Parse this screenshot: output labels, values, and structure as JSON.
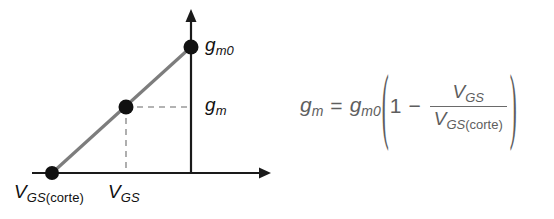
{
  "figure": {
    "background_color": "#ffffff"
  },
  "plot": {
    "axis_color": "#1a1a1a",
    "line_color": "#7a7a7a",
    "dash_color": "#9a9a9a",
    "point_color": "#111111",
    "x_axis": {
      "y": 173,
      "x_start": 32,
      "x_end": 265,
      "arrow": "right"
    },
    "y_axis": {
      "x": 191,
      "y_top": 15,
      "y_bottom": 173,
      "arrow": "up"
    },
    "points": [
      {
        "name": "cutoff-point",
        "x": 52,
        "y": 173,
        "x_label": "V_GS(corte)",
        "y_label": "0"
      },
      {
        "name": "operating-point",
        "x": 126,
        "y": 107,
        "x_label": "V_GS",
        "y_label": "g_m"
      },
      {
        "name": "max-point",
        "x": 191,
        "y": 47,
        "x_label": "0",
        "y_label": "g_m0"
      }
    ],
    "labels": {
      "gm0": {
        "base": "g",
        "sub": "m",
        "sub_trailing": "0"
      },
      "gm": {
        "base": "g",
        "sub": "m"
      },
      "vgs_corte": {
        "base": "V",
        "sub": "GS",
        "sub_roman": "(corte)"
      },
      "vgs": {
        "base": "V",
        "sub": "GS"
      }
    }
  },
  "equation": {
    "color": "#5e5e5e",
    "plain_text": "g_m = g_m0 (1 - V_GS / V_GS(corte))",
    "lhs": {
      "base": "g",
      "sub": "m"
    },
    "equals": "=",
    "coefficient": {
      "base": "g",
      "sub": "m",
      "sub_trailing": "0"
    },
    "paren_open": "(",
    "paren_close": ")",
    "one": "1",
    "minus": "−",
    "numerator": {
      "base": "V",
      "sub": "GS"
    },
    "denominator": {
      "base": "V",
      "sub": "GS",
      "sub_roman": "(corte)"
    }
  }
}
